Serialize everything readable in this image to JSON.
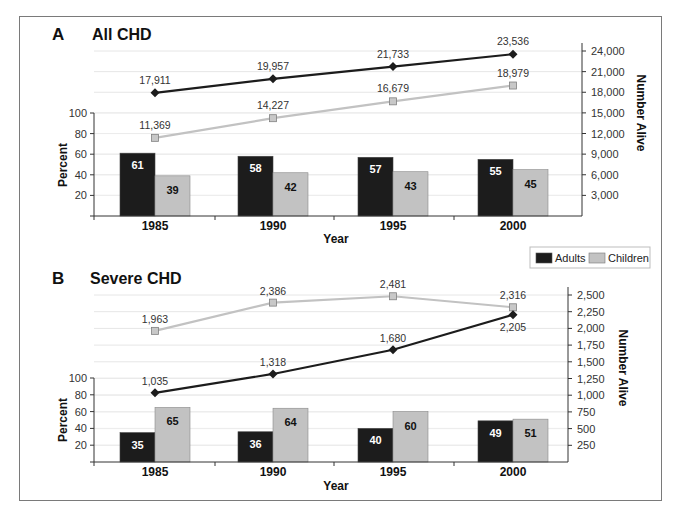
{
  "legend": {
    "items": [
      {
        "label": "Adults",
        "color": "#1c1c1c"
      },
      {
        "label": "Children",
        "color": "#c2c2c2"
      }
    ]
  },
  "colors": {
    "adults_bar": "#1c1c1c",
    "children_bar": "#c2c2c2",
    "adults_line": "#1c1c1c",
    "children_line": "#c2c2c2",
    "gridline": "#e6e6e6",
    "axis": "#333333"
  },
  "panels": [
    {
      "letter": "A",
      "title": "All CHD",
      "left_axis_title": "Percent",
      "right_axis_title": "Number Alive",
      "x_axis_title": "Year",
      "left_ticks": [
        "100",
        "80",
        "60",
        "40",
        "20"
      ],
      "right_ticks": [
        "24,000",
        "21,000",
        "18,000",
        "15,000",
        "12,000",
        "9,000",
        "6,000",
        "3,000"
      ]
    },
    {
      "letter": "B",
      "title": "Severe CHD",
      "left_axis_title": "Percent",
      "right_axis_title": "Number Alive",
      "x_axis_title": "Year",
      "left_ticks": [
        "100",
        "80",
        "60",
        "40",
        "20"
      ],
      "right_ticks": [
        "2,500",
        "2,250",
        "2,000",
        "1,750",
        "1,500",
        "1,250",
        "1,000",
        "750",
        "500",
        "250"
      ]
    }
  ],
  "chart_data": [
    {
      "type": "bar+line",
      "title": "A All CHD",
      "xlabel": "Year",
      "ylabel": "Percent",
      "y2label": "Number Alive",
      "categories": [
        "1985",
        "1990",
        "1995",
        "2000"
      ],
      "ylim": [
        0,
        100
      ],
      "y2lim": [
        0,
        24000
      ],
      "grid": true,
      "legend_position": "bottom-right between panels",
      "bar_series": [
        {
          "name": "Adults",
          "values": [
            61,
            58,
            57,
            55
          ],
          "axis": "left"
        },
        {
          "name": "Children",
          "values": [
            39,
            42,
            43,
            45
          ],
          "axis": "left"
        }
      ],
      "line_series": [
        {
          "name": "Adults",
          "values": [
            17911,
            19957,
            21733,
            23536
          ],
          "labels": [
            "17,911",
            "19,957",
            "21,733",
            "23,536"
          ],
          "axis": "right",
          "marker": "diamond"
        },
        {
          "name": "Children",
          "values": [
            11369,
            14227,
            16679,
            18979
          ],
          "labels": [
            "11,369",
            "14,227",
            "16,679",
            "18,979"
          ],
          "axis": "right",
          "marker": "square"
        }
      ],
      "right_ticks": [
        3000,
        6000,
        9000,
        12000,
        15000,
        18000,
        21000,
        24000
      ],
      "left_ticks": [
        20,
        40,
        60,
        80,
        100
      ]
    },
    {
      "type": "bar+line",
      "title": "B Severe CHD",
      "xlabel": "Year",
      "ylabel": "Percent",
      "y2label": "Number Alive",
      "categories": [
        "1985",
        "1990",
        "1995",
        "2000"
      ],
      "ylim": [
        0,
        100
      ],
      "y2lim": [
        0,
        2500
      ],
      "grid": true,
      "bar_series": [
        {
          "name": "Adults",
          "values": [
            35,
            36,
            40,
            49
          ],
          "axis": "left"
        },
        {
          "name": "Children",
          "values": [
            65,
            64,
            60,
            51
          ],
          "axis": "left"
        }
      ],
      "line_series": [
        {
          "name": "Adults",
          "values": [
            1035,
            1318,
            1680,
            2205
          ],
          "labels": [
            "1,035",
            "1,318",
            "1,680",
            "2,205"
          ],
          "axis": "right",
          "marker": "diamond"
        },
        {
          "name": "Children",
          "values": [
            1963,
            2386,
            2481,
            2316
          ],
          "labels": [
            "1,963",
            "2,386",
            "2,481",
            "2,316"
          ],
          "axis": "right",
          "marker": "square"
        }
      ],
      "right_ticks": [
        250,
        500,
        750,
        1000,
        1250,
        1500,
        1750,
        2000,
        2250,
        2500
      ],
      "left_ticks": [
        20,
        40,
        60,
        80,
        100
      ]
    }
  ]
}
